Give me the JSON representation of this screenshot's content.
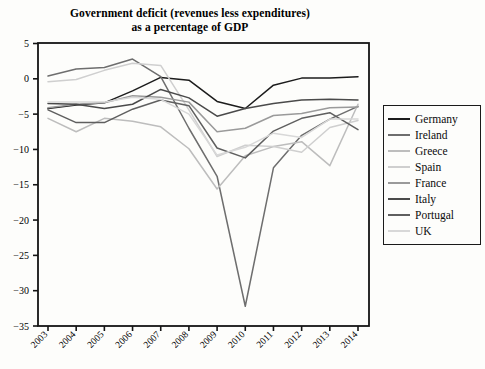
{
  "title": {
    "line1": "Government deficit (revenues less expenditures)",
    "line2": "as a percentage of GDP"
  },
  "legend": {
    "position": "right",
    "items": [
      {
        "label": "Germany",
        "color": "#1c1c1c"
      },
      {
        "label": "Ireland",
        "color": "#6e6e6e"
      },
      {
        "label": "Greece",
        "color": "#bdbdbd"
      },
      {
        "label": "Spain",
        "color": "#cfcfcf"
      },
      {
        "label": "France",
        "color": "#9a9a9a"
      },
      {
        "label": "Italy",
        "color": "#4a4a4a"
      },
      {
        "label": "Portugal",
        "color": "#5f5f5f"
      },
      {
        "label": "UK",
        "color": "#d8d8d8"
      }
    ]
  },
  "axes": {
    "ylabel": "",
    "xlabel": "",
    "ylim": [
      -35,
      5
    ],
    "yticks": [
      "5",
      "0",
      "−5",
      "−10",
      "−15",
      "−20",
      "−25",
      "−30",
      "−35"
    ],
    "xticks": [
      "2003",
      "2004",
      "2005",
      "2006",
      "2007",
      "2008",
      "2009",
      "2010",
      "2011",
      "2012",
      "2013",
      "2014"
    ],
    "grid": false
  },
  "chart_data": {
    "type": "line",
    "title": "Government deficit (revenues less expenditures) as a percentage of GDP",
    "xlabel": "",
    "ylabel": "Percentage of GDP",
    "ylim": [
      -35,
      5
    ],
    "grid": false,
    "legend_position": "right",
    "categories": [
      "2003",
      "2004",
      "2005",
      "2006",
      "2007",
      "2008",
      "2009",
      "2010",
      "2011",
      "2012",
      "2013",
      "2014"
    ],
    "series": [
      {
        "name": "Germany",
        "color": "#1c1c1c",
        "values": [
          -4.2,
          -3.7,
          -3.4,
          -1.7,
          0.2,
          -0.2,
          -3.2,
          -4.2,
          -0.9,
          0.1,
          0.1,
          0.3
        ]
      },
      {
        "name": "Ireland",
        "color": "#6e6e6e",
        "values": [
          0.4,
          1.4,
          1.6,
          2.8,
          0.3,
          -7.0,
          -13.8,
          -32.2,
          -12.6,
          -8.0,
          -5.7,
          -3.9
        ]
      },
      {
        "name": "Greece",
        "color": "#bdbdbd",
        "values": [
          -5.6,
          -7.5,
          -5.6,
          -6.0,
          -6.8,
          -9.9,
          -15.6,
          -10.9,
          -9.6,
          -8.9,
          -12.3,
          -3.6
        ]
      },
      {
        "name": "Spain",
        "color": "#cfcfcf",
        "values": [
          -0.4,
          -0.1,
          1.2,
          2.2,
          1.9,
          -4.4,
          -11.0,
          -9.4,
          -9.6,
          -10.4,
          -6.9,
          -5.9
        ]
      },
      {
        "name": "France",
        "color": "#9a9a9a",
        "values": [
          -4.1,
          -3.6,
          -3.4,
          -2.4,
          -2.6,
          -3.3,
          -7.5,
          -7.0,
          -5.2,
          -4.9,
          -4.1,
          -4.0
        ]
      },
      {
        "name": "Italy",
        "color": "#4a4a4a",
        "values": [
          -3.5,
          -3.6,
          -4.2,
          -3.6,
          -1.5,
          -2.7,
          -5.3,
          -4.2,
          -3.5,
          -3.0,
          -2.9,
          -3.0
        ]
      },
      {
        "name": "Portugal",
        "color": "#5f5f5f",
        "values": [
          -4.4,
          -6.2,
          -6.2,
          -4.3,
          -3.0,
          -3.8,
          -9.8,
          -11.2,
          -7.4,
          -5.6,
          -4.8,
          -7.2
        ]
      },
      {
        "name": "UK",
        "color": "#d8d8d8",
        "values": [
          -3.3,
          -3.3,
          -3.3,
          -2.6,
          -2.9,
          -5.0,
          -10.8,
          -9.7,
          -7.7,
          -8.3,
          -5.7,
          -5.7
        ]
      }
    ]
  }
}
